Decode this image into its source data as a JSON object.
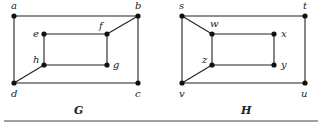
{
  "graphs": [
    {
      "name": "G",
      "label_pos": [
        74,
        114
      ],
      "vertices": [
        {
          "id": "a",
          "x": 14,
          "y": 16,
          "lx": 11,
          "ly": 9
        },
        {
          "id": "b",
          "x": 138,
          "y": 16,
          "lx": 135,
          "ly": 9
        },
        {
          "id": "c",
          "x": 138,
          "y": 83,
          "lx": 135,
          "ly": 97
        },
        {
          "id": "d",
          "x": 14,
          "y": 83,
          "lx": 11,
          "ly": 97
        },
        {
          "id": "e",
          "x": 44,
          "y": 34,
          "lx": 33,
          "ly": 37
        },
        {
          "id": "f",
          "x": 107,
          "y": 34,
          "lx": 99,
          "ly": 29
        },
        {
          "id": "g",
          "x": 107,
          "y": 65,
          "lx": 113,
          "ly": 68
        },
        {
          "id": "h",
          "x": 44,
          "y": 65,
          "lx": 33,
          "ly": 63
        }
      ],
      "edges": [
        [
          "a",
          "b"
        ],
        [
          "b",
          "c"
        ],
        [
          "c",
          "d"
        ],
        [
          "d",
          "a"
        ],
        [
          "e",
          "f"
        ],
        [
          "f",
          "g"
        ],
        [
          "g",
          "h"
        ],
        [
          "h",
          "e"
        ],
        [
          "b",
          "f"
        ],
        [
          "d",
          "h"
        ]
      ]
    },
    {
      "name": "H",
      "label_pos": [
        241,
        114
      ],
      "vertices": [
        {
          "id": "s",
          "x": 182,
          "y": 16,
          "lx": 179,
          "ly": 9
        },
        {
          "id": "t",
          "x": 305,
          "y": 16,
          "lx": 303,
          "ly": 9
        },
        {
          "id": "u",
          "x": 305,
          "y": 83,
          "lx": 301,
          "ly": 97
        },
        {
          "id": "v",
          "x": 182,
          "y": 83,
          "lx": 179,
          "ly": 97
        },
        {
          "id": "w",
          "x": 212,
          "y": 34,
          "lx": 210,
          "ly": 27
        },
        {
          "id": "x",
          "x": 274,
          "y": 34,
          "lx": 281,
          "ly": 37
        },
        {
          "id": "y",
          "x": 274,
          "y": 65,
          "lx": 281,
          "ly": 68
        },
        {
          "id": "z",
          "x": 212,
          "y": 65,
          "lx": 202,
          "ly": 63
        }
      ],
      "edges": [
        [
          "s",
          "t"
        ],
        [
          "t",
          "u"
        ],
        [
          "u",
          "v"
        ],
        [
          "v",
          "s"
        ],
        [
          "w",
          "x"
        ],
        [
          "x",
          "y"
        ],
        [
          "y",
          "z"
        ],
        [
          "z",
          "w"
        ],
        [
          "s",
          "w"
        ],
        [
          "v",
          "z"
        ]
      ]
    }
  ],
  "rule": {
    "x1": 4,
    "x2": 318,
    "y": 121
  }
}
